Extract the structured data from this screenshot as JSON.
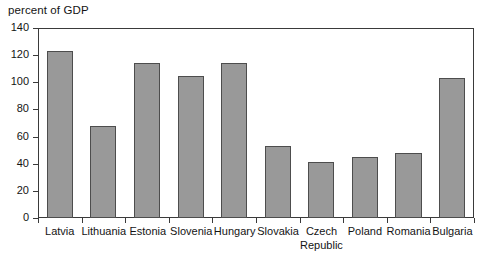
{
  "chart_data": {
    "type": "bar",
    "title": "percent of GDP",
    "xlabel": "",
    "ylabel": "",
    "ylim": [
      0,
      140
    ],
    "yticks": [
      0,
      20,
      40,
      60,
      80,
      100,
      120,
      140
    ],
    "grid": false,
    "legend": null,
    "bar_color": "#999999",
    "bar_edge_color": "#4d4d4d",
    "categories": [
      "Latvia",
      "Lithuania",
      "Estonia",
      "Slovenia",
      "Hungary",
      "Slovakia",
      "Czech Republic",
      "Poland",
      "Romania",
      "Bulgaria"
    ],
    "category_lines": [
      [
        "Latvia"
      ],
      [
        "Lithuania"
      ],
      [
        "Estonia"
      ],
      [
        "Slovenia"
      ],
      [
        "Hungary"
      ],
      [
        "Slovakia"
      ],
      [
        "Czech",
        "Republic"
      ],
      [
        "Poland"
      ],
      [
        "Romania"
      ],
      [
        "Bulgaria"
      ]
    ],
    "values": [
      123,
      68,
      114,
      105,
      114,
      53,
      41,
      45,
      48,
      103
    ]
  }
}
